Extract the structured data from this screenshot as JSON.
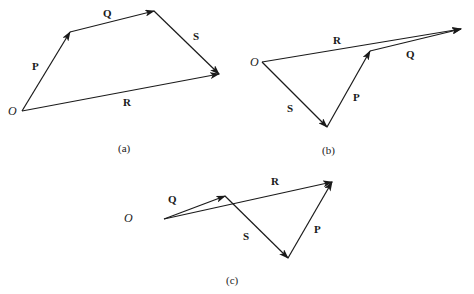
{
  "figure": {
    "colors": {
      "stroke": "#1a1a1a",
      "background": "#ffffff"
    },
    "panels": [
      {
        "id": "a",
        "caption": "(a)",
        "caption_pos": [
          118,
          152
        ],
        "origin_label": "O",
        "origin": [
          22,
          111
        ],
        "origin_label_pos": [
          8,
          115
        ],
        "vectors": [
          {
            "name": "P",
            "from": [
              22,
              111
            ],
            "to": [
              70,
              32
            ],
            "label_pos": [
              32,
              70
            ]
          },
          {
            "name": "Q",
            "from": [
              70,
              32
            ],
            "to": [
              154,
              11
            ],
            "label_pos": [
              103,
              17
            ]
          },
          {
            "name": "S",
            "from": [
              154,
              11
            ],
            "to": [
              219,
              74
            ],
            "label_pos": [
              193,
              40
            ]
          },
          {
            "name": "R",
            "from": [
              22,
              111
            ],
            "to": [
              219,
              74
            ],
            "label_pos": [
              123,
              106
            ]
          }
        ]
      },
      {
        "id": "b",
        "caption": "(b)",
        "caption_pos": [
          322,
          154
        ],
        "origin_label": "O",
        "origin": [
          262,
          62
        ],
        "origin_label_pos": [
          250,
          66
        ],
        "vectors": [
          {
            "name": "S",
            "from": [
              262,
              62
            ],
            "to": [
              327,
              127
            ],
            "label_pos": [
              287,
              112
            ]
          },
          {
            "name": "P",
            "from": [
              327,
              127
            ],
            "to": [
              370,
              51
            ],
            "label_pos": [
              353,
              101
            ]
          },
          {
            "name": "Q",
            "from": [
              370,
              51
            ],
            "to": [
              461,
              29
            ],
            "label_pos": [
              406,
              58
            ]
          },
          {
            "name": "R",
            "from": [
              262,
              62
            ],
            "to": [
              461,
              29
            ],
            "label_pos": [
              333,
              44
            ]
          }
        ]
      },
      {
        "id": "c",
        "caption": "(c)",
        "caption_pos": [
          226,
          284
        ],
        "origin_label": "O",
        "origin": [
          164,
          219
        ],
        "origin_label_pos": [
          124,
          222
        ],
        "vectors": [
          {
            "name": "Q",
            "from": [
              164,
              219
            ],
            "to": [
              225,
              196
            ],
            "label_pos": [
              168,
              203
            ]
          },
          {
            "name": "S",
            "from": [
              225,
              196
            ],
            "to": [
              288,
              258
            ],
            "label_pos": [
              243,
              240
            ]
          },
          {
            "name": "P",
            "from": [
              288,
              258
            ],
            "to": [
              332,
              182
            ],
            "label_pos": [
              314,
              233
            ]
          },
          {
            "name": "R",
            "from": [
              164,
              219
            ],
            "to": [
              332,
              182
            ],
            "label_pos": [
              271,
              185
            ]
          }
        ]
      }
    ]
  }
}
